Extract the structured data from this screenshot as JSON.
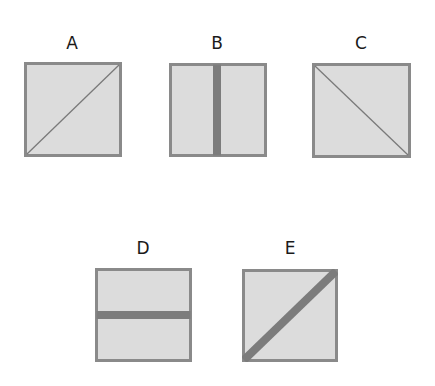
{
  "colors": {
    "fill": "#dcdcdc",
    "border": "#8a8a8a",
    "thin_line": "#7a7a7a",
    "thick_bar": "#7c7c7c",
    "label": "#1a1a1a"
  },
  "figures": [
    {
      "id": "A",
      "label": "A",
      "x": 24,
      "y": 62,
      "w": 98,
      "h": 95,
      "mark": "diagonal-thin-bl-tr",
      "label_x": 52,
      "label_y": 35
    },
    {
      "id": "B",
      "label": "B",
      "x": 169,
      "y": 63,
      "w": 98,
      "h": 94,
      "mark": "vertical-thick-center",
      "label_x": 197,
      "label_y": 35
    },
    {
      "id": "C",
      "label": "C",
      "x": 312,
      "y": 63,
      "w": 99,
      "h": 95,
      "mark": "diagonal-thin-tl-br",
      "label_x": 341,
      "label_y": 35
    },
    {
      "id": "D",
      "label": "D",
      "x": 95,
      "y": 268,
      "w": 97,
      "h": 94,
      "mark": "horizontal-thick-center",
      "label_x": 123,
      "label_y": 240
    },
    {
      "id": "E",
      "label": "E",
      "x": 242,
      "y": 269,
      "w": 96,
      "h": 93,
      "mark": "diagonal-thick-bl-tr",
      "label_x": 270,
      "label_y": 240
    }
  ]
}
